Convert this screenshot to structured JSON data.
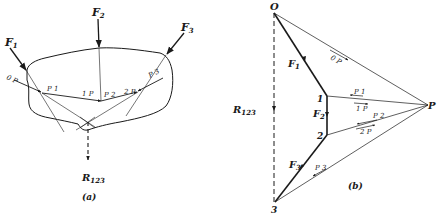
{
  "figure": {
    "panel_a": {
      "caption": "(a)",
      "forces": [
        {
          "name": "F",
          "sub": "1"
        },
        {
          "name": "F",
          "sub": "2"
        },
        {
          "name": "F",
          "sub": "3"
        }
      ],
      "string_labels": {
        "op": "0 P",
        "p1": "P 1",
        "one_p": "1 P",
        "p2": "P 2",
        "two_p": "2 P",
        "p3": "P 3"
      },
      "resultant": {
        "name": "R",
        "sub": "123"
      }
    },
    "panel_b": {
      "caption": "(b)",
      "vertices": {
        "o": "O",
        "one": "1",
        "two": "2",
        "three": "3",
        "pole": "P"
      },
      "forces": [
        {
          "name": "F",
          "sub": "1"
        },
        {
          "name": "F",
          "sub": "2"
        },
        {
          "name": "F",
          "sub": "3"
        }
      ],
      "ray_labels": {
        "op": "0 P",
        "p1": "P 1",
        "one_p": "1 P",
        "p2": "P 2",
        "two_p": "2 P",
        "p3": "P 3"
      },
      "resultant": {
        "name": "R",
        "sub": "123"
      }
    },
    "colors": {
      "ink": "#1a1a1a",
      "paper": "#ffffff"
    }
  }
}
